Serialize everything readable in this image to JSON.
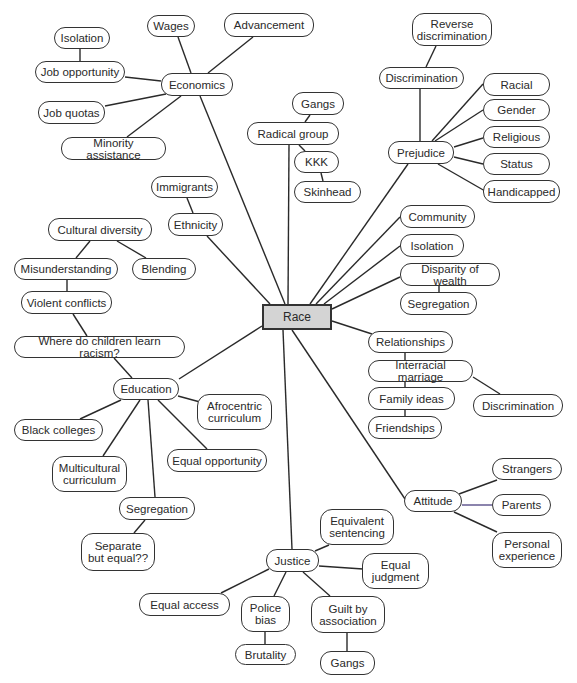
{
  "diagram": {
    "type": "concept-map",
    "center": {
      "id": "race",
      "label": "Race",
      "x": 262,
      "y": 304,
      "w": 70,
      "h": 26
    },
    "nodes": [
      {
        "id": "economics",
        "label": "Economics",
        "x": 161,
        "y": 73,
        "w": 72,
        "h": 23
      },
      {
        "id": "wages",
        "label": "Wages",
        "x": 147,
        "y": 15,
        "w": 48,
        "h": 22
      },
      {
        "id": "advancement",
        "label": "Advancement",
        "x": 224,
        "y": 13,
        "w": 90,
        "h": 24
      },
      {
        "id": "isolation_econ",
        "label": "Isolation",
        "x": 54,
        "y": 27,
        "w": 56,
        "h": 22
      },
      {
        "id": "job_opportunity",
        "label": "Job opportunity",
        "x": 35,
        "y": 61,
        "w": 90,
        "h": 22
      },
      {
        "id": "job_quotas",
        "label": "Job quotas",
        "x": 38,
        "y": 101,
        "w": 67,
        "h": 23
      },
      {
        "id": "minority_assistance",
        "label": "Minority assistance",
        "x": 61,
        "y": 137,
        "w": 105,
        "h": 23
      },
      {
        "id": "gangs_radical",
        "label": "Gangs",
        "x": 292,
        "y": 92,
        "w": 52,
        "h": 23
      },
      {
        "id": "radical_group",
        "label": "Radical group",
        "x": 247,
        "y": 122,
        "w": 92,
        "h": 23
      },
      {
        "id": "kkk",
        "label": "KKK",
        "x": 294,
        "y": 151,
        "w": 45,
        "h": 22
      },
      {
        "id": "skinhead",
        "label": "Skinhead",
        "x": 294,
        "y": 181,
        "w": 67,
        "h": 22
      },
      {
        "id": "reverse_discrimination",
        "label": "Reverse\ndiscrimination",
        "x": 412,
        "y": 13,
        "w": 80,
        "h": 33
      },
      {
        "id": "discrimination_top",
        "label": "Discrimination",
        "x": 379,
        "y": 67,
        "w": 85,
        "h": 22
      },
      {
        "id": "prejudice",
        "label": "Prejudice",
        "x": 388,
        "y": 141,
        "w": 66,
        "h": 23
      },
      {
        "id": "racial",
        "label": "Racial",
        "x": 483,
        "y": 73,
        "w": 67,
        "h": 23
      },
      {
        "id": "gender",
        "label": "Gender",
        "x": 483,
        "y": 99,
        "w": 67,
        "h": 22
      },
      {
        "id": "religious",
        "label": "Religious",
        "x": 483,
        "y": 126,
        "w": 67,
        "h": 22
      },
      {
        "id": "status",
        "label": "Status",
        "x": 483,
        "y": 153,
        "w": 67,
        "h": 22
      },
      {
        "id": "handicapped",
        "label": "Handicapped",
        "x": 483,
        "y": 180,
        "w": 77,
        "h": 23
      },
      {
        "id": "immigrants",
        "label": "Immigrants",
        "x": 151,
        "y": 176,
        "w": 67,
        "h": 22
      },
      {
        "id": "ethnicity",
        "label": "Ethnicity",
        "x": 168,
        "y": 213,
        "w": 55,
        "h": 23
      },
      {
        "id": "cultural_diversity",
        "label": "Cultural diversity",
        "x": 48,
        "y": 218,
        "w": 104,
        "h": 23
      },
      {
        "id": "misunderstanding",
        "label": "Misunderstanding",
        "x": 14,
        "y": 258,
        "w": 104,
        "h": 22
      },
      {
        "id": "blending",
        "label": "Blending",
        "x": 132,
        "y": 258,
        "w": 64,
        "h": 22
      },
      {
        "id": "violent_conflicts",
        "label": "Violent conflicts",
        "x": 21,
        "y": 291,
        "w": 91,
        "h": 23
      },
      {
        "id": "where_children",
        "label": "Where do children learn racism?",
        "x": 14,
        "y": 336,
        "w": 171,
        "h": 22
      },
      {
        "id": "community",
        "label": "Community",
        "x": 400,
        "y": 205,
        "w": 75,
        "h": 23
      },
      {
        "id": "isolation_right",
        "label": "Isolation",
        "x": 400,
        "y": 234,
        "w": 64,
        "h": 23
      },
      {
        "id": "disparity",
        "label": "Disparity of wealth",
        "x": 400,
        "y": 263,
        "w": 100,
        "h": 23
      },
      {
        "id": "segregation_right",
        "label": "Segregation",
        "x": 400,
        "y": 292,
        "w": 77,
        "h": 23
      },
      {
        "id": "relationships",
        "label": "Relationships",
        "x": 368,
        "y": 331,
        "w": 85,
        "h": 22
      },
      {
        "id": "interracial_marriage",
        "label": "Interracial marriage",
        "x": 368,
        "y": 360,
        "w": 105,
        "h": 22
      },
      {
        "id": "family_ideas",
        "label": "Family ideas",
        "x": 368,
        "y": 387,
        "w": 87,
        "h": 23
      },
      {
        "id": "friendships",
        "label": "Friendships",
        "x": 368,
        "y": 416,
        "w": 74,
        "h": 23
      },
      {
        "id": "discrimination_right",
        "label": "Discrimination",
        "x": 473,
        "y": 394,
        "w": 90,
        "h": 23
      },
      {
        "id": "education",
        "label": "Education",
        "x": 113,
        "y": 378,
        "w": 66,
        "h": 22
      },
      {
        "id": "afrocentric",
        "label": "Afrocentric\ncurriculum",
        "x": 197,
        "y": 394,
        "w": 75,
        "h": 36
      },
      {
        "id": "black_colleges",
        "label": "Black colleges",
        "x": 14,
        "y": 419,
        "w": 89,
        "h": 22
      },
      {
        "id": "multicultural",
        "label": "Multicultural\ncurriculum",
        "x": 52,
        "y": 456,
        "w": 75,
        "h": 36
      },
      {
        "id": "equal_opportunity",
        "label": "Equal opportunity",
        "x": 167,
        "y": 449,
        "w": 100,
        "h": 23
      },
      {
        "id": "segregation_edu",
        "label": "Segregation",
        "x": 119,
        "y": 497,
        "w": 76,
        "h": 23
      },
      {
        "id": "separate_equal",
        "label": "Separate\nbut equal??",
        "x": 81,
        "y": 533,
        "w": 74,
        "h": 38
      },
      {
        "id": "attitude",
        "label": "Attitude",
        "x": 404,
        "y": 490,
        "w": 58,
        "h": 22
      },
      {
        "id": "strangers",
        "label": "Strangers",
        "x": 492,
        "y": 458,
        "w": 70,
        "h": 22
      },
      {
        "id": "parents",
        "label": "Parents",
        "x": 492,
        "y": 494,
        "w": 59,
        "h": 22
      },
      {
        "id": "personal_experience",
        "label": "Personal\nexperience",
        "x": 492,
        "y": 532,
        "w": 70,
        "h": 36
      },
      {
        "id": "justice",
        "label": "Justice",
        "x": 266,
        "y": 549,
        "w": 53,
        "h": 23
      },
      {
        "id": "equivalent_sentencing",
        "label": "Equivalent\nsentencing",
        "x": 320,
        "y": 509,
        "w": 74,
        "h": 36
      },
      {
        "id": "equal_judgment",
        "label": "Equal\njudgment",
        "x": 362,
        "y": 553,
        "w": 67,
        "h": 36
      },
      {
        "id": "equal_access",
        "label": "Equal access",
        "x": 139,
        "y": 593,
        "w": 91,
        "h": 23
      },
      {
        "id": "police_bias",
        "label": "Police\nbias",
        "x": 241,
        "y": 596,
        "w": 49,
        "h": 36
      },
      {
        "id": "guilt_association",
        "label": "Guilt by\nassociation",
        "x": 311,
        "y": 596,
        "w": 74,
        "h": 37
      },
      {
        "id": "brutality",
        "label": "Brutality",
        "x": 235,
        "y": 644,
        "w": 61,
        "h": 21
      },
      {
        "id": "gangs_justice",
        "label": "Gangs",
        "x": 320,
        "y": 651,
        "w": 55,
        "h": 24
      }
    ],
    "edges": [
      {
        "from": "race",
        "to": "economics",
        "x1": 285,
        "y1": 304,
        "x2": 200,
        "y2": 96
      },
      {
        "from": "economics",
        "to": "wages",
        "x1": 191,
        "y1": 73,
        "x2": 178,
        "y2": 37
      },
      {
        "from": "economics",
        "to": "advancement",
        "x1": 208,
        "y1": 73,
        "x2": 253,
        "y2": 37
      },
      {
        "from": "isolation_econ",
        "to": "job_opportunity",
        "x1": 80,
        "y1": 49,
        "x2": 80,
        "y2": 61
      },
      {
        "from": "economics",
        "to": "job_opportunity",
        "x1": 161,
        "y1": 81,
        "x2": 125,
        "y2": 77
      },
      {
        "from": "economics",
        "to": "job_quotas",
        "x1": 166,
        "y1": 94,
        "x2": 105,
        "y2": 106
      },
      {
        "from": "economics",
        "to": "minority_assistance",
        "x1": 181,
        "y1": 96,
        "x2": 127,
        "y2": 137
      },
      {
        "from": "race",
        "to": "radical_group",
        "x1": 288,
        "y1": 304,
        "x2": 289,
        "y2": 145
      },
      {
        "from": "radical_group",
        "to": "gangs_radical",
        "x1": 305,
        "y1": 122,
        "x2": 310,
        "y2": 115
      },
      {
        "from": "radical_group",
        "to": "kkk",
        "x1": 299,
        "y1": 145,
        "x2": 305,
        "y2": 151
      },
      {
        "from": "kkk",
        "to": "skinhead",
        "x1": 321,
        "y1": 173,
        "x2": 323,
        "y2": 181
      },
      {
        "from": "reverse_discrimination",
        "to": "discrimination_top",
        "x1": 436,
        "y1": 46,
        "x2": 426,
        "y2": 67
      },
      {
        "from": "discrimination_top",
        "to": "prejudice",
        "x1": 420,
        "y1": 89,
        "x2": 420,
        "y2": 141
      },
      {
        "from": "prejudice",
        "to": "racial",
        "x1": 432,
        "y1": 141,
        "x2": 483,
        "y2": 84
      },
      {
        "from": "prejudice",
        "to": "gender",
        "x1": 435,
        "y1": 141,
        "x2": 483,
        "y2": 110
      },
      {
        "from": "prejudice",
        "to": "religious",
        "x1": 454,
        "y1": 147,
        "x2": 483,
        "y2": 138
      },
      {
        "from": "prejudice",
        "to": "status",
        "x1": 454,
        "y1": 157,
        "x2": 483,
        "y2": 164
      },
      {
        "from": "prejudice",
        "to": "handicapped",
        "x1": 438,
        "y1": 164,
        "x2": 485,
        "y2": 191
      },
      {
        "from": "race",
        "to": "prejudice",
        "x1": 310,
        "y1": 304,
        "x2": 408,
        "y2": 164
      },
      {
        "from": "immigrants",
        "to": "ethnicity",
        "x1": 187,
        "y1": 198,
        "x2": 193,
        "y2": 213
      },
      {
        "from": "race",
        "to": "ethnicity",
        "x1": 270,
        "y1": 304,
        "x2": 207,
        "y2": 236
      },
      {
        "from": "cultural_diversity",
        "to": "misunderstanding",
        "x1": 90,
        "y1": 241,
        "x2": 76,
        "y2": 258
      },
      {
        "from": "cultural_diversity",
        "to": "blending",
        "x1": 117,
        "y1": 241,
        "x2": 146,
        "y2": 258
      },
      {
        "from": "misunderstanding",
        "to": "violent_conflicts",
        "x1": 67,
        "y1": 280,
        "x2": 67,
        "y2": 291
      },
      {
        "from": "violent_conflicts",
        "to": "where_children",
        "x1": 73,
        "y1": 314,
        "x2": 87,
        "y2": 336
      },
      {
        "from": "race",
        "to": "community",
        "x1": 316,
        "y1": 304,
        "x2": 400,
        "y2": 217
      },
      {
        "from": "race",
        "to": "isolation_right",
        "x1": 324,
        "y1": 304,
        "x2": 400,
        "y2": 246
      },
      {
        "from": "race",
        "to": "disparity",
        "x1": 332,
        "y1": 309,
        "x2": 400,
        "y2": 277
      },
      {
        "from": "disparity",
        "to": "segregation_right",
        "x1": 439,
        "y1": 286,
        "x2": 439,
        "y2": 292
      },
      {
        "from": "race",
        "to": "relationships",
        "x1": 332,
        "y1": 321,
        "x2": 372,
        "y2": 334
      },
      {
        "from": "relationships",
        "to": "interracial_marriage",
        "x1": 405,
        "y1": 353,
        "x2": 405,
        "y2": 360
      },
      {
        "from": "interracial_marriage",
        "to": "family_ideas",
        "x1": 405,
        "y1": 382,
        "x2": 405,
        "y2": 387
      },
      {
        "from": "family_ideas",
        "to": "friendships",
        "x1": 405,
        "y1": 410,
        "x2": 405,
        "y2": 416
      },
      {
        "from": "interracial_marriage",
        "to": "discrimination_right",
        "x1": 473,
        "y1": 377,
        "x2": 500,
        "y2": 394
      },
      {
        "from": "race",
        "to": "education",
        "x1": 262,
        "y1": 326,
        "x2": 179,
        "y2": 379
      },
      {
        "from": "where_children",
        "to": "education",
        "x1": 114,
        "y1": 358,
        "x2": 132,
        "y2": 378
      },
      {
        "from": "education",
        "to": "afrocentric",
        "x1": 178,
        "y1": 396,
        "x2": 200,
        "y2": 402
      },
      {
        "from": "education",
        "to": "black_colleges",
        "x1": 121,
        "y1": 400,
        "x2": 80,
        "y2": 419
      },
      {
        "from": "education",
        "to": "multicultural",
        "x1": 140,
        "y1": 400,
        "x2": 103,
        "y2": 456
      },
      {
        "from": "education",
        "to": "equal_opportunity",
        "x1": 158,
        "y1": 400,
        "x2": 207,
        "y2": 449
      },
      {
        "from": "education",
        "to": "segregation_edu",
        "x1": 148,
        "y1": 400,
        "x2": 155,
        "y2": 497
      },
      {
        "from": "segregation_edu",
        "to": "separate_equal",
        "x1": 145,
        "y1": 520,
        "x2": 134,
        "y2": 533
      },
      {
        "from": "race",
        "to": "attitude",
        "x1": 292,
        "y1": 330,
        "x2": 405,
        "y2": 499
      },
      {
        "from": "attitude",
        "to": "strangers",
        "x1": 459,
        "y1": 494,
        "x2": 497,
        "y2": 480
      },
      {
        "from": "attitude",
        "to": "parents",
        "x1": 462,
        "y1": 505,
        "x2": 492,
        "y2": 505,
        "stroke": "#5a4f8a"
      },
      {
        "from": "attitude",
        "to": "personal_experience",
        "x1": 454,
        "y1": 512,
        "x2": 497,
        "y2": 532
      },
      {
        "from": "race",
        "to": "justice",
        "x1": 283,
        "y1": 330,
        "x2": 292,
        "y2": 549
      },
      {
        "from": "justice",
        "to": "equivalent_sentencing",
        "x1": 315,
        "y1": 551,
        "x2": 329,
        "y2": 545
      },
      {
        "from": "justice",
        "to": "equal_judgment",
        "x1": 319,
        "y1": 566,
        "x2": 363,
        "y2": 569
      },
      {
        "from": "justice",
        "to": "equal_access",
        "x1": 269,
        "y1": 569,
        "x2": 221,
        "y2": 593
      },
      {
        "from": "justice",
        "to": "police_bias",
        "x1": 286,
        "y1": 572,
        "x2": 274,
        "y2": 596
      },
      {
        "from": "justice",
        "to": "guilt_association",
        "x1": 303,
        "y1": 572,
        "x2": 330,
        "y2": 596
      },
      {
        "from": "police_bias",
        "to": "brutality",
        "x1": 265,
        "y1": 632,
        "x2": 265,
        "y2": 644
      },
      {
        "from": "guilt_association",
        "to": "gangs_justice",
        "x1": 347,
        "y1": 633,
        "x2": 347,
        "y2": 651
      }
    ]
  }
}
